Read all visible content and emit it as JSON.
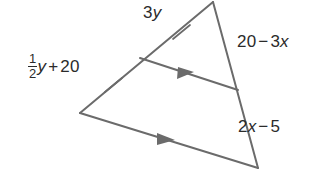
{
  "figure": {
    "type": "triangle-with-midsegment",
    "background_color": "#ffffff",
    "stroke_color": "#6b6b6b",
    "text_color": "#2b2b2b",
    "vertices": {
      "apex": [
        213,
        2
      ],
      "left": [
        80,
        113
      ],
      "bottom_right": [
        258,
        168
      ]
    },
    "midsegment": {
      "start": [
        140,
        58
      ],
      "end": [
        238,
        90
      ]
    },
    "tick_marks": [
      {
        "at": [
          181,
          32
        ],
        "side": "upper-left"
      },
      {
        "at": [
          113,
          85
        ],
        "side": "lower-left"
      }
    ],
    "arrow_markers": [
      {
        "at": [
          186,
          74
        ],
        "side": "midsegment"
      },
      {
        "at": [
          166,
          140
        ],
        "side": "bottom"
      }
    ]
  },
  "labels": {
    "left_side": {
      "name": "half-y-plus-20",
      "fraction_numerator": "1",
      "fraction_denominator": "2",
      "variable": "y",
      "operator": "+",
      "constant": "20",
      "text": "1/2 y + 20"
    },
    "top_side": {
      "name": "three-y",
      "coefficient": "3",
      "variable": "y",
      "text": "3y"
    },
    "right_upper_side": {
      "name": "twenty-minus-three-x",
      "constant": "20",
      "operator": "−",
      "coefficient": "3",
      "variable": "x",
      "text": "20 − 3x"
    },
    "right_lower_side": {
      "name": "two-x-minus-five",
      "coefficient": "2",
      "variable": "x",
      "operator": "−",
      "constant": "5",
      "text": "2x − 5"
    }
  }
}
